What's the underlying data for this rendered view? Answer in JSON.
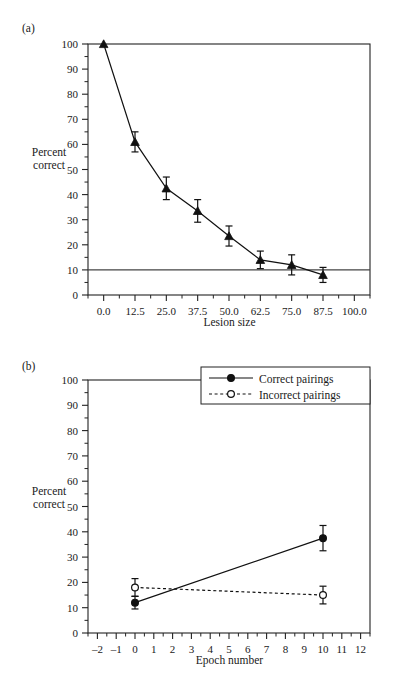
{
  "figure": {
    "panels": [
      {
        "id": "a",
        "label": "(a)",
        "ylabel_line1": "Percent",
        "ylabel_line2": "correct"
      },
      {
        "id": "b",
        "label": "(b)",
        "ylabel_line1": "Percent",
        "ylabel_line2": "correct"
      }
    ]
  },
  "chart_data": [
    {
      "type": "line",
      "panel": "a",
      "title": "",
      "xlabel": "Lesion size",
      "ylabel": "Percent correct",
      "xlim": [
        -6.25,
        106.25
      ],
      "ylim": [
        0,
        100
      ],
      "xticks": [
        0,
        12.5,
        25,
        37.5,
        50,
        62.5,
        75,
        87.5,
        100
      ],
      "xticklabels": [
        "0.0",
        "12.5",
        "25.0",
        "37.5",
        "50.0",
        "62.5",
        "75.0",
        "87.5",
        "100.0"
      ],
      "yticks": [
        0,
        10,
        20,
        30,
        40,
        50,
        60,
        70,
        80,
        90,
        100
      ],
      "yticklabels": [
        "0",
        "10",
        "20",
        "30",
        "40",
        "50",
        "60",
        "70",
        "80",
        "90",
        "100"
      ],
      "grid": false,
      "legend": "none",
      "marker": "filled-triangle",
      "linestyle": "solid",
      "x": [
        0,
        12.5,
        25,
        37.5,
        50,
        62.5,
        75,
        87.5
      ],
      "values": [
        100,
        61,
        42.5,
        33.5,
        23.5,
        14,
        12,
        8
      ],
      "errors": [
        0,
        4,
        4.5,
        4.5,
        4,
        3.5,
        4,
        3
      ],
      "reference_line": {
        "y": 10,
        "label": "chance",
        "style": "solid"
      }
    },
    {
      "type": "line",
      "panel": "b",
      "title": "",
      "xlabel": "Epoch number",
      "ylabel": "Percent correct",
      "xlim": [
        -2.5,
        12.5
      ],
      "ylim": [
        0,
        100
      ],
      "xticks": [
        -2,
        -1,
        0,
        1,
        2,
        3,
        4,
        5,
        6,
        7,
        8,
        9,
        10,
        11,
        12
      ],
      "xticklabels": [
        "–2",
        "–1",
        "0",
        "1",
        "2",
        "3",
        "4",
        "5",
        "6",
        "7",
        "8",
        "9",
        "10",
        "11",
        "12"
      ],
      "yticks": [
        0,
        10,
        20,
        30,
        40,
        50,
        60,
        70,
        80,
        90,
        100
      ],
      "yticklabels": [
        "0",
        "10",
        "20",
        "30",
        "40",
        "50",
        "60",
        "70",
        "80",
        "90",
        "100"
      ],
      "grid": false,
      "legend": "upper right",
      "x": [
        0,
        10
      ],
      "series": [
        {
          "name": "Correct pairings",
          "values": [
            12,
            37.5
          ],
          "errors": [
            2.5,
            5
          ],
          "marker": "filled-circle",
          "linestyle": "solid"
        },
        {
          "name": "Incorrect pairings",
          "values": [
            18,
            15
          ],
          "errors": [
            3.5,
            3.5
          ],
          "marker": "open-circle",
          "linestyle": "dotted"
        }
      ]
    }
  ]
}
